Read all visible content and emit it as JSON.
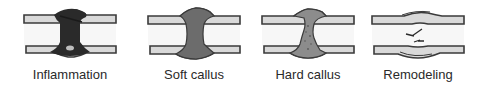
{
  "figure": {
    "stages": [
      {
        "id": "inflammation",
        "label": "Inflammation",
        "callus_color": "#2a2a2a"
      },
      {
        "id": "soft-callus",
        "label": "Soft callus",
        "callus_color": "#6c6c6c"
      },
      {
        "id": "hard-callus",
        "label": "Hard callus",
        "callus_color": "#8c8c8c"
      },
      {
        "id": "remodeling",
        "label": "Remodeling",
        "callus_color": null
      }
    ]
  },
  "colors": {
    "background": "#ffffff",
    "cortex_fill": "#d9d9d9",
    "outline": "#3a3a3a",
    "marrow": "#f7f7f7"
  }
}
